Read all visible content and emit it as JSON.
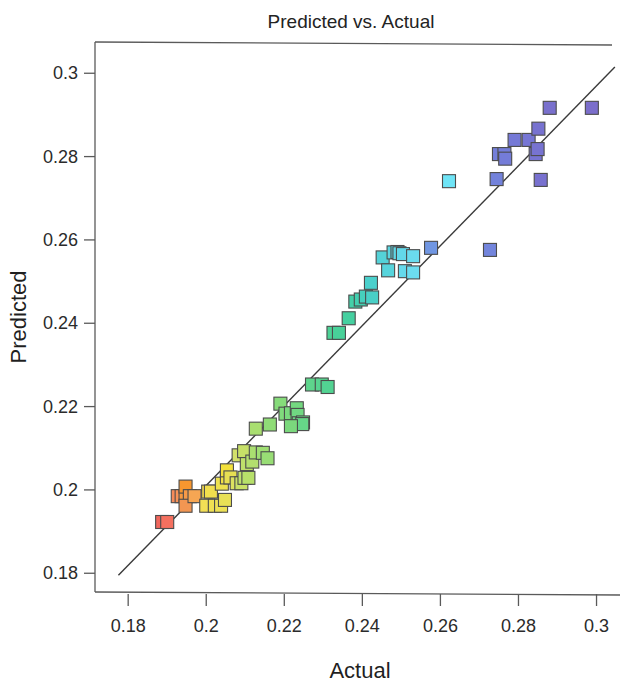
{
  "chart_data": {
    "type": "scatter",
    "title": "Predicted vs. Actual",
    "xlabel": "Actual",
    "ylabel": "Predicted",
    "xlim": [
      0.1715,
      0.3055
    ],
    "ylim": [
      0.1755,
      0.3075
    ],
    "grid": false,
    "legend": null,
    "xticks": [
      0.18,
      0.2,
      0.22,
      0.24,
      0.26,
      0.28,
      0.3
    ],
    "yticks": [
      0.18,
      0.2,
      0.22,
      0.24,
      0.26,
      0.28,
      0.3
    ],
    "xtick_labels": [
      "0.18",
      "0.2",
      "0.22",
      "0.24",
      "0.26",
      "0.28",
      "0.3"
    ],
    "ytick_labels": [
      "0.18",
      "0.2",
      "0.22",
      "0.24",
      "0.26",
      "0.28",
      "0.3"
    ],
    "marker": "square",
    "marker_size_px": 13,
    "colormap": "rainbow (red low → blue high)",
    "reference_line": {
      "label": "y = x identity line",
      "x0": 0.1775,
      "y0": 0.1795,
      "x1": 0.3047,
      "y1": 0.3015
    },
    "points": [
      {
        "x": 0.1887,
        "y": 0.1923,
        "color": "#F0665C"
      },
      {
        "x": 0.19,
        "y": 0.1923,
        "color": "#F4705F"
      },
      {
        "x": 0.1927,
        "y": 0.1985,
        "color": "#F58B5A"
      },
      {
        "x": 0.1937,
        "y": 0.1985,
        "color": "#F79358"
      },
      {
        "x": 0.1947,
        "y": 0.1985,
        "color": "#F8993F"
      },
      {
        "x": 0.1947,
        "y": 0.2008,
        "color": "#F8972F"
      },
      {
        "x": 0.1958,
        "y": 0.1985,
        "color": "#F79A47"
      },
      {
        "x": 0.1947,
        "y": 0.1962,
        "color": "#F29652"
      },
      {
        "x": 0.197,
        "y": 0.1985,
        "color": "#F6A653"
      },
      {
        "x": 0.2005,
        "y": 0.1996,
        "color": "#F3DB4B"
      },
      {
        "x": 0.2012,
        "y": 0.1996,
        "color": "#F1DE4E"
      },
      {
        "x": 0.2,
        "y": 0.1962,
        "color": "#F3DF55"
      },
      {
        "x": 0.2022,
        "y": 0.1962,
        "color": "#EFE053"
      },
      {
        "x": 0.2038,
        "y": 0.1962,
        "color": "#EDE155"
      },
      {
        "x": 0.204,
        "y": 0.2015,
        "color": "#EDE14F"
      },
      {
        "x": 0.2048,
        "y": 0.1976,
        "color": "#E8E055"
      },
      {
        "x": 0.2053,
        "y": 0.203,
        "color": "#F0E046"
      },
      {
        "x": 0.2053,
        "y": 0.2047,
        "color": "#F3E13B"
      },
      {
        "x": 0.2062,
        "y": 0.203,
        "color": "#E7DF53"
      },
      {
        "x": 0.2078,
        "y": 0.2016,
        "color": "#DCE160"
      },
      {
        "x": 0.209,
        "y": 0.2016,
        "color": "#C9E067"
      },
      {
        "x": 0.2098,
        "y": 0.2029,
        "color": "#BFE06B"
      },
      {
        "x": 0.2108,
        "y": 0.2029,
        "color": "#B7E06A"
      },
      {
        "x": 0.2083,
        "y": 0.2083,
        "color": "#D2E06A"
      },
      {
        "x": 0.2097,
        "y": 0.2093,
        "color": "#C7E068"
      },
      {
        "x": 0.2104,
        "y": 0.2062,
        "color": "#BFE06B"
      },
      {
        "x": 0.2118,
        "y": 0.2068,
        "color": "#B3DF6E"
      },
      {
        "x": 0.2127,
        "y": 0.209,
        "color": "#AADE70"
      },
      {
        "x": 0.2145,
        "y": 0.2089,
        "color": "#9FDE73"
      },
      {
        "x": 0.2127,
        "y": 0.2147,
        "color": "#A9DE70"
      },
      {
        "x": 0.2157,
        "y": 0.2076,
        "color": "#98DD75"
      },
      {
        "x": 0.2163,
        "y": 0.2157,
        "color": "#8FDC77"
      },
      {
        "x": 0.219,
        "y": 0.2207,
        "color": "#86DB7A"
      },
      {
        "x": 0.2203,
        "y": 0.2183,
        "color": "#80DA7C"
      },
      {
        "x": 0.2217,
        "y": 0.2184,
        "color": "#7AD97E"
      },
      {
        "x": 0.2232,
        "y": 0.2196,
        "color": "#74D880"
      },
      {
        "x": 0.2234,
        "y": 0.218,
        "color": "#70D782"
      },
      {
        "x": 0.2237,
        "y": 0.216,
        "color": "#6DD784"
      },
      {
        "x": 0.2248,
        "y": 0.2162,
        "color": "#68D686"
      },
      {
        "x": 0.2246,
        "y": 0.2158,
        "color": "#66D688"
      },
      {
        "x": 0.2217,
        "y": 0.2153,
        "color": "#7BD87D"
      },
      {
        "x": 0.2271,
        "y": 0.2253,
        "color": "#5ED58C"
      },
      {
        "x": 0.2296,
        "y": 0.2253,
        "color": "#57D48F"
      },
      {
        "x": 0.2311,
        "y": 0.2247,
        "color": "#52D392"
      },
      {
        "x": 0.2326,
        "y": 0.2377,
        "color": "#4CD296"
      },
      {
        "x": 0.234,
        "y": 0.2377,
        "color": "#48D199"
      },
      {
        "x": 0.2365,
        "y": 0.2412,
        "color": "#45D0A0"
      },
      {
        "x": 0.2382,
        "y": 0.2452,
        "color": "#44CFA8"
      },
      {
        "x": 0.2396,
        "y": 0.2457,
        "color": "#43CFB0"
      },
      {
        "x": 0.2409,
        "y": 0.2464,
        "color": "#46CFBC"
      },
      {
        "x": 0.2425,
        "y": 0.2462,
        "color": "#49CFC6"
      },
      {
        "x": 0.2422,
        "y": 0.2497,
        "color": "#4BD0CC"
      },
      {
        "x": 0.2452,
        "y": 0.2558,
        "color": "#54D2D8"
      },
      {
        "x": 0.248,
        "y": 0.257,
        "color": "#5AD5E0"
      },
      {
        "x": 0.249,
        "y": 0.2571,
        "color": "#5ED6E4"
      },
      {
        "x": 0.2495,
        "y": 0.2568,
        "color": "#60D7E6"
      },
      {
        "x": 0.2466,
        "y": 0.2527,
        "color": "#57D4DC"
      },
      {
        "x": 0.2504,
        "y": 0.2566,
        "color": "#63D8E9"
      },
      {
        "x": 0.2509,
        "y": 0.2525,
        "color": "#65D9EB"
      },
      {
        "x": 0.253,
        "y": 0.2561,
        "color": "#6ADBEE"
      },
      {
        "x": 0.253,
        "y": 0.2522,
        "color": "#6CDCEF"
      },
      {
        "x": 0.2622,
        "y": 0.2741,
        "color": "#6FE4F6"
      },
      {
        "x": 0.2576,
        "y": 0.2581,
        "color": "#7096E2"
      },
      {
        "x": 0.2727,
        "y": 0.2576,
        "color": "#7385DC"
      },
      {
        "x": 0.2744,
        "y": 0.2746,
        "color": "#7382DB"
      },
      {
        "x": 0.275,
        "y": 0.2806,
        "color": "#747FDA"
      },
      {
        "x": 0.2764,
        "y": 0.2806,
        "color": "#747DD9"
      },
      {
        "x": 0.2766,
        "y": 0.2795,
        "color": "#747CD8"
      },
      {
        "x": 0.279,
        "y": 0.284,
        "color": "#7579D6"
      },
      {
        "x": 0.2826,
        "y": 0.284,
        "color": "#7676D4"
      },
      {
        "x": 0.2844,
        "y": 0.2806,
        "color": "#7774D2"
      },
      {
        "x": 0.2849,
        "y": 0.2818,
        "color": "#7773D1"
      },
      {
        "x": 0.2851,
        "y": 0.2867,
        "color": "#7772D0"
      },
      {
        "x": 0.2857,
        "y": 0.2744,
        "color": "#7871CF"
      },
      {
        "x": 0.2988,
        "y": 0.2917,
        "color": "#7B6ECB"
      },
      {
        "x": 0.288,
        "y": 0.2917,
        "color": "#7970CD"
      }
    ]
  }
}
